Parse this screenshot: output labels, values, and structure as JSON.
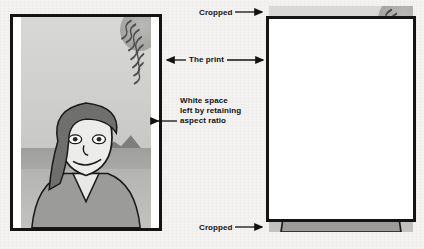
{
  "diagram": {
    "background_color": "#f3f2f0",
    "frame_color": "#141414"
  },
  "annotations": {
    "cropped_top": "Cropped",
    "cropped_bottom": "Cropped",
    "the_print": "The print",
    "white_space": "White space\nleft by retaining\naspect ratio"
  },
  "panels": {
    "left": {
      "name": "aspect-ratio-preserved-print",
      "description": "Print frame with image scaled to fit; white space remains at left and right"
    },
    "right": {
      "name": "cropped-print",
      "description": "Print frame with image scaled to fill; top and bottom of image are cropped"
    }
  },
  "scene": {
    "sky_color": "#d4d4d2",
    "sea_color": "#a4a4a2",
    "ground_color": "#bbbbb9",
    "hill_color": "#7e7e7c",
    "sun_label": "sun-starburst",
    "figure_label": "woman-portrait",
    "skin_color": "#ececeb",
    "hair_color": "#6f6f6d",
    "shirt_color": "#9b9b99"
  },
  "icons": {
    "arrow_right": "arrow-right-icon",
    "arrow_left": "arrow-left-icon",
    "arrow_double": "arrow-double-horizontal-icon"
  }
}
